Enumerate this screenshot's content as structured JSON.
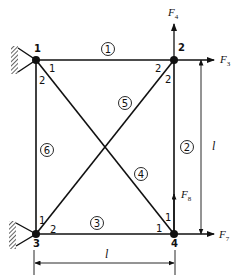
{
  "diagram": {
    "type": "truss",
    "colors": {
      "line": "#111111",
      "background": "#ffffff"
    },
    "nodes": [
      {
        "id": "1",
        "label": "1",
        "x": 36,
        "y": 60,
        "support": "pin"
      },
      {
        "id": "2",
        "label": "2",
        "x": 174,
        "y": 60
      },
      {
        "id": "3",
        "label": "3",
        "x": 36,
        "y": 234,
        "support": "pin"
      },
      {
        "id": "4",
        "label": "4",
        "x": 174,
        "y": 234
      }
    ],
    "members": [
      {
        "id": "1",
        "label": "1",
        "from": "1",
        "to": "2"
      },
      {
        "id": "2",
        "label": "2",
        "from": "2",
        "to": "4"
      },
      {
        "id": "3",
        "label": "3",
        "from": "3",
        "to": "4"
      },
      {
        "id": "4",
        "label": "4",
        "from": "1",
        "to": "4"
      },
      {
        "id": "5",
        "label": "5",
        "from": "3",
        "to": "2"
      },
      {
        "id": "6",
        "label": "6",
        "from": "1",
        "to": "3"
      }
    ],
    "local_end_labels": {
      "n1_a": "1",
      "n1_b": "2",
      "n2_a": "2",
      "n2_b": "2",
      "n3_a": "1",
      "n3_b": "2",
      "n4_a": "1",
      "n4_b": "1"
    },
    "forces": [
      {
        "id": "F4",
        "letter": "F",
        "sub": "4",
        "node": "2",
        "direction": "up"
      },
      {
        "id": "F3",
        "letter": "F",
        "sub": "3",
        "node": "2",
        "direction": "right"
      },
      {
        "id": "F8",
        "letter": "F",
        "sub": "8",
        "node": "4",
        "direction": "up"
      },
      {
        "id": "F7",
        "letter": "F",
        "sub": "7",
        "node": "4",
        "direction": "right"
      }
    ],
    "dimensions": {
      "vertical": "l",
      "horizontal": "l"
    }
  }
}
